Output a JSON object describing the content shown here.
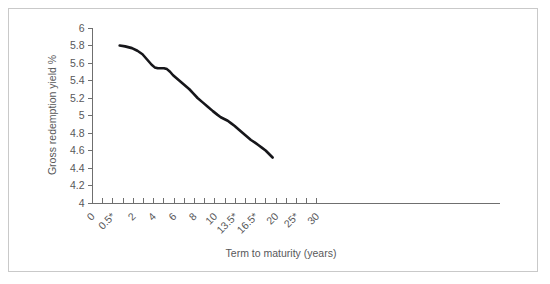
{
  "chart_data": {
    "type": "line",
    "title": "",
    "xlabel": "Term to maturity (years)",
    "ylabel": "Gross redemption yield %",
    "grid": false,
    "legend": "none",
    "xlim": [
      0,
      30
    ],
    "ylim": [
      4,
      6
    ],
    "ytick_labels": [
      "4",
      "4.2",
      "4.4",
      "4.6",
      "4.8",
      "5",
      "5.2",
      "5.4",
      "5.6",
      "5.8",
      "6"
    ],
    "ytick_values": [
      4,
      4.2,
      4.4,
      4.6,
      4.8,
      5,
      5.2,
      5.4,
      5.6,
      5.8,
      6
    ],
    "xtick_labels": [
      "0",
      "0.5*",
      "2",
      "4",
      "6",
      "8",
      "10",
      "13.5*",
      "16.5*",
      "20",
      "25*",
      "30"
    ],
    "xtick_positions": [
      0,
      1,
      2,
      3,
      4,
      5,
      6,
      7,
      8,
      9,
      10,
      11
    ],
    "series": [
      {
        "name": "Gross redemption yield",
        "color": "#16161a",
        "x": [
          1.0,
          1.4,
          1.9,
          2.4,
          2.9,
          3.2,
          3.5,
          3.8,
          4.1,
          4.4,
          4.7,
          5.0,
          5.3,
          5.6,
          5.9,
          6.3,
          6.7,
          7.1,
          7.5,
          7.9,
          8.3,
          8.8,
          9.3,
          9.8,
          10.4,
          11.0,
          11.6,
          12.2,
          12.8,
          13.4,
          14.0,
          14.6,
          15.2,
          15.8,
          16.4,
          17.0,
          17.6,
          18.2,
          18.8,
          19.4
        ],
        "values": [
          5.8,
          5.79,
          5.77,
          5.74,
          5.7,
          5.66,
          5.62,
          5.58,
          5.55,
          5.54,
          5.54,
          5.54,
          5.53,
          5.5,
          5.46,
          5.42,
          5.38,
          5.34,
          5.3,
          5.25,
          5.2,
          5.15,
          5.1,
          5.05,
          5.01,
          4.98,
          4.96,
          4.94,
          4.91,
          4.88,
          4.84,
          4.8,
          4.76,
          4.72,
          4.69,
          4.66,
          4.63,
          4.6,
          4.56,
          4.52
        ]
      }
    ]
  }
}
